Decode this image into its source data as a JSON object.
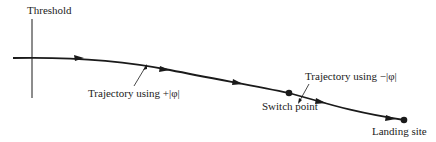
{
  "diagram": {
    "labels": {
      "threshold": "Threshold",
      "trajectory_plus": "Trajectory using +|φ|",
      "switch_point": "Switch point",
      "trajectory_minus": "Trajectory using −|φ|",
      "landing_site": "Landing site"
    },
    "colors": {
      "stroke": "#1a1a1a",
      "text": "#222222",
      "background": "#ffffff"
    }
  }
}
